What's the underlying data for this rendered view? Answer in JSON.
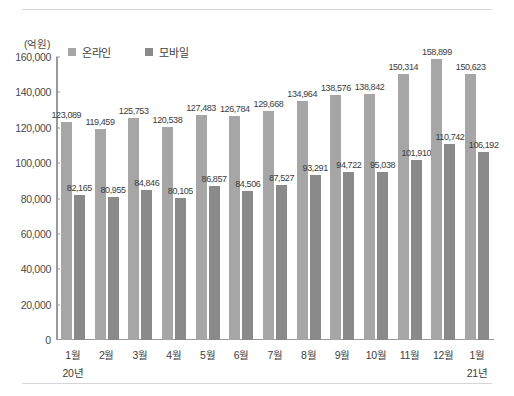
{
  "chart_data": {
    "type": "bar",
    "title": "",
    "unit_label": "(억원)",
    "xlabel": "",
    "ylabel": "",
    "ylim": [
      0,
      160000
    ],
    "ytick_values": [
      0,
      20000,
      40000,
      60000,
      80000,
      100000,
      120000,
      140000,
      160000
    ],
    "ytick_labels": [
      "0",
      "20,000",
      "40,000",
      "60,000",
      "80,000",
      "100,000",
      "120,000",
      "140,000",
      "160,000"
    ],
    "grid": false,
    "legend_position": "top-left",
    "categories": [
      "1월",
      "2월",
      "3월",
      "4월",
      "5월",
      "6월",
      "7월",
      "8월",
      "9월",
      "10월",
      "11월",
      "12월",
      "1월"
    ],
    "year_markers": [
      {
        "label": "20년",
        "category_index": 0
      },
      {
        "label": "21년",
        "category_index": 12
      }
    ],
    "series": [
      {
        "name": "온라인",
        "color": "#a6a6a6",
        "values": [
          123089,
          119459,
          125753,
          120538,
          127483,
          126784,
          129668,
          134964,
          138576,
          138842,
          150314,
          158899,
          150623
        ],
        "labels": [
          "123,089",
          "119,459",
          "125,753",
          "120,538",
          "127,483",
          "126,784",
          "129,668",
          "134,964",
          "138,576",
          "138,842",
          "150,314",
          "158,899",
          "150,623"
        ]
      },
      {
        "name": "모바일",
        "color": "#8a8a8a",
        "values": [
          82165,
          80955,
          84846,
          80105,
          86857,
          84506,
          87527,
          93291,
          94722,
          95038,
          101910,
          110742,
          106192
        ],
        "labels": [
          "82,165",
          "80,955",
          "84,846",
          "80,105",
          "86,857",
          "84,506",
          "87,527",
          "93,291",
          "94,722",
          "95,038",
          "101,910",
          "110,742",
          "106,192"
        ]
      }
    ]
  }
}
